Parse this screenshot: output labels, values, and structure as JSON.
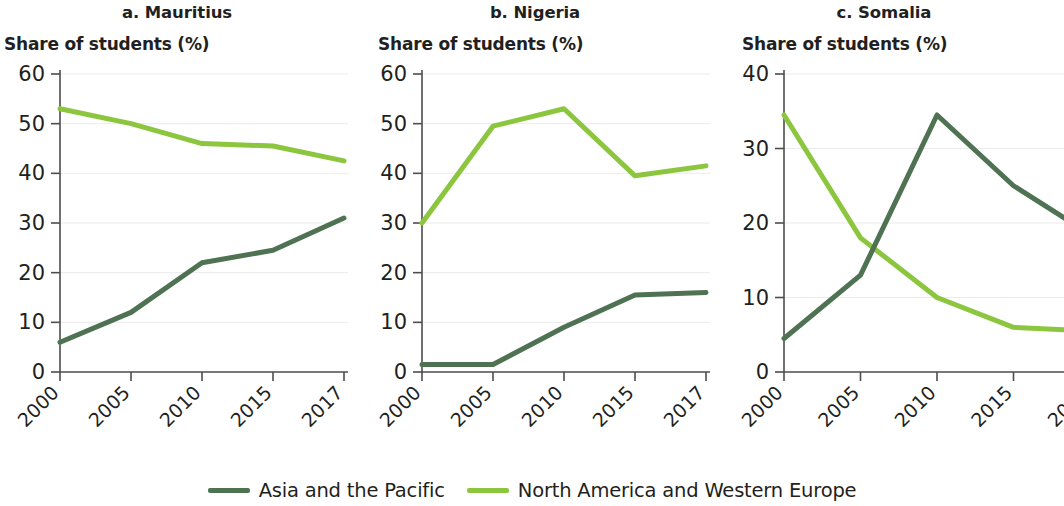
{
  "chart_data": [
    {
      "type": "line",
      "title": "a. Mauritius",
      "ylabel": "Share of students (%)",
      "xlabel": "",
      "categories": [
        "2000",
        "2005",
        "2010",
        "2015",
        "2017"
      ],
      "x": [
        2000,
        2005,
        2010,
        2015,
        2017
      ],
      "ylim": [
        0,
        60
      ],
      "yticks": [
        0,
        10,
        20,
        30,
        40,
        50,
        60
      ],
      "grid": true,
      "series": [
        {
          "name": "Asia and the Pacific",
          "color": "#4f7253",
          "values": [
            6,
            12,
            22,
            24.5,
            31
          ]
        },
        {
          "name": "North America and Western Europe",
          "color": "#8cc63e",
          "values": [
            53,
            50,
            46,
            45.5,
            42.5
          ]
        }
      ]
    },
    {
      "type": "line",
      "title": "b. Nigeria",
      "ylabel": "Share of students (%)",
      "xlabel": "",
      "categories": [
        "2000",
        "2005",
        "2010",
        "2015",
        "2017"
      ],
      "x": [
        2000,
        2005,
        2010,
        2015,
        2017
      ],
      "ylim": [
        0,
        60
      ],
      "yticks": [
        0,
        10,
        20,
        30,
        40,
        50,
        60
      ],
      "grid": true,
      "series": [
        {
          "name": "Asia and the Pacific",
          "color": "#4f7253",
          "values": [
            1.5,
            1.5,
            9,
            15.5,
            16
          ]
        },
        {
          "name": "North America and Western Europe",
          "color": "#8cc63e",
          "values": [
            30,
            49.5,
            53,
            39.5,
            41.5
          ]
        }
      ]
    },
    {
      "type": "line",
      "title": "c. Somalia",
      "ylabel": "Share of students (%)",
      "xlabel": "",
      "categories": [
        "2000",
        "2005",
        "2010",
        "2015",
        "2017"
      ],
      "x": [
        2000,
        2005,
        2010,
        2015,
        2017
      ],
      "ylim": [
        0,
        40
      ],
      "yticks": [
        0,
        10,
        20,
        30,
        40
      ],
      "grid": true,
      "series": [
        {
          "name": "Asia and the Pacific",
          "color": "#4f7253",
          "values": [
            4.5,
            13,
            34.5,
            25,
            18.5
          ]
        },
        {
          "name": "North America and Western Europe",
          "color": "#8cc63e",
          "values": [
            34.5,
            18,
            10,
            6,
            5.5
          ]
        }
      ]
    }
  ],
  "legend": {
    "position": "bottom-center",
    "items": [
      {
        "label": "Asia and the Pacific",
        "color": "#4f7253"
      },
      {
        "label": "North America and Western Europe",
        "color": "#8cc63e"
      }
    ]
  },
  "colors": {
    "asia_pacific": "#4f7253",
    "north_america_western_europe": "#8cc63e",
    "gridline": "#ebebeb",
    "axis": "#4d4d4d",
    "text": "#231f20"
  }
}
